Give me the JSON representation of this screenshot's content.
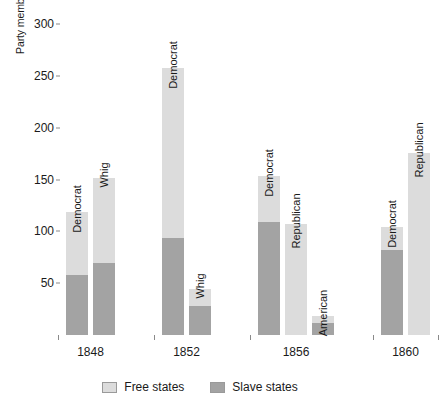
{
  "chart_data": {
    "type": "bar",
    "stacked": true,
    "title": "",
    "xlabel": "",
    "ylabel": "Party members in House of Representatives",
    "ylim": [
      0,
      310
    ],
    "yticks": [
      50,
      100,
      150,
      200,
      250,
      300
    ],
    "grid": false,
    "legend_position": "bottom",
    "series": [
      {
        "name": "Free states",
        "color": "#dcdcdc"
      },
      {
        "name": "Slave states",
        "color": "#a3a3a3"
      }
    ],
    "groups": [
      {
        "year": "1848",
        "bars": [
          {
            "party": "Democrat",
            "slave": 58,
            "free": 61,
            "total": 119
          },
          {
            "party": "Whig",
            "slave": 70,
            "free": 82,
            "total": 152
          }
        ]
      },
      {
        "year": "1852",
        "bars": [
          {
            "party": "Democrat",
            "slave": 94,
            "free": 164,
            "total": 258
          },
          {
            "party": "Whig",
            "slave": 28,
            "free": 16,
            "total": 44
          }
        ]
      },
      {
        "year": "1856",
        "bars": [
          {
            "party": "Democrat",
            "slave": 109,
            "free": 45,
            "total": 154
          },
          {
            "party": "Republican",
            "slave": 0,
            "free": 107,
            "total": 107
          },
          {
            "party": "American",
            "slave": 12,
            "free": 6,
            "total": 18
          }
        ]
      },
      {
        "year": "1860",
        "bars": [
          {
            "party": "Democrat",
            "slave": 82,
            "free": 22,
            "total": 104
          },
          {
            "party": "Republican",
            "slave": 0,
            "free": 176,
            "total": 176
          }
        ]
      }
    ]
  },
  "axis": {
    "y_title": "Party members in House of Representatives",
    "y_tick_labels": [
      "50",
      "100",
      "150",
      "200",
      "250",
      "300"
    ],
    "x_tick_labels": [
      "1848",
      "1852",
      "1856",
      "1860"
    ]
  },
  "legend": {
    "items": [
      {
        "label": "Free states",
        "color": "#dcdcdc"
      },
      {
        "label": "Slave states",
        "color": "#a3a3a3"
      }
    ]
  }
}
